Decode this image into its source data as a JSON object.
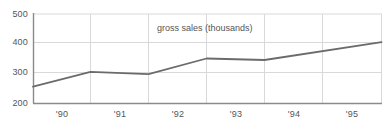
{
  "chart_data": {
    "type": "line",
    "title": "",
    "annotation": "gross sales (thousands)",
    "xlabel": "",
    "ylabel": "",
    "categories": [
      "'90",
      "'91",
      "'92",
      "'93",
      "'94",
      "'95"
    ],
    "x": [
      1990,
      1991,
      1992,
      1993,
      1994,
      1995
    ],
    "values": [
      255,
      305,
      297,
      350,
      345,
      405
    ],
    "series": [
      {
        "name": "gross sales (thousands)",
        "values": [
          255,
          305,
          297,
          350,
          345,
          405
        ]
      }
    ],
    "ylim": [
      200,
      500
    ],
    "yticks": [
      200,
      300,
      400,
      500
    ],
    "ytick_labels": [
      "200",
      "300",
      "400",
      "500"
    ],
    "xtick_labels": [
      "'90",
      "'91",
      "'92",
      "'93",
      "'94",
      "'95"
    ],
    "grid": true,
    "grid_color": "#d9d9d9",
    "line_color": "#6b6b6b",
    "axis_color": "#8a8a8a",
    "legend": "none",
    "legend_position": "none",
    "background": "#ffffff"
  },
  "axis": {
    "y_labels": [
      "500",
      "400",
      "300",
      "200"
    ],
    "x_labels": [
      "'90",
      "'91",
      "'92",
      "'93",
      "'94",
      "'95"
    ]
  }
}
